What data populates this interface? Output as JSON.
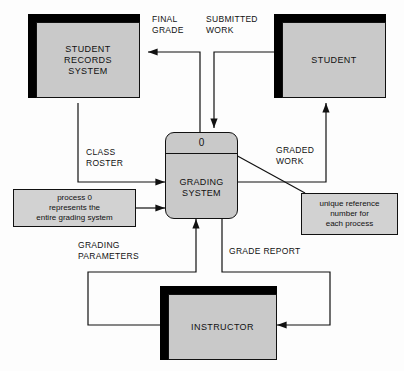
{
  "diagram": {
    "colors": {
      "entity_fill": "#c9c9c9",
      "note_fill": "#d2d2d2",
      "shadow": "#000000",
      "stroke": "#111111",
      "background": "#fdfdfd"
    }
  },
  "entities": [
    {
      "id": "student_records_system",
      "label": "STUDENT\nRECORDS\nSYSTEM"
    },
    {
      "id": "student",
      "label": "STUDENT"
    },
    {
      "id": "instructor",
      "label": "INSTRUCTOR"
    }
  ],
  "process": {
    "number": "0",
    "name": "GRADING\nSYSTEM"
  },
  "notes": [
    {
      "id": "note_process_zero",
      "text": "process 0\nrepresents the\nentire grading system"
    },
    {
      "id": "note_unique_reference",
      "text": "unique reference\nnumber for\neach process"
    }
  ],
  "flows": [
    {
      "id": "final_grade",
      "label": "FINAL\nGRADE",
      "from": "grading_system",
      "to": "student_records_system"
    },
    {
      "id": "submitted_work",
      "label": "SUBMITTED\nWORK",
      "from": "student",
      "to": "grading_system"
    },
    {
      "id": "class_roster",
      "label": "CLASS\nROSTER",
      "from": "student_records_system",
      "to": "grading_system"
    },
    {
      "id": "graded_work",
      "label": "GRADED\nWORK",
      "from": "grading_system",
      "to": "student"
    },
    {
      "id": "grading_parameters",
      "label": "GRADING\nPARAMETERS",
      "from": "instructor",
      "to": "grading_system"
    },
    {
      "id": "grade_report",
      "label": "GRADE REPORT",
      "from": "grading_system",
      "to": "instructor"
    }
  ]
}
